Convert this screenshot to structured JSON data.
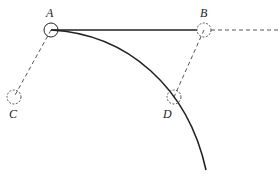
{
  "diagram": {
    "points": {
      "A": {
        "label": "A",
        "cx": 51,
        "cy": 30,
        "r": 7,
        "style": "solid"
      },
      "B": {
        "label": "B",
        "cx": 204,
        "cy": 30,
        "r": 7,
        "style": "dashed"
      },
      "C": {
        "label": "C",
        "cx": 14,
        "cy": 97,
        "r": 7,
        "style": "dashed"
      },
      "D": {
        "label": "D",
        "cx": 174,
        "cy": 97,
        "r": 7,
        "style": "dashed"
      }
    },
    "labels": {
      "A": "A",
      "B": "B",
      "C": "C",
      "D": "D"
    },
    "lines": [
      {
        "from": "A",
        "to": "B",
        "style": "solid"
      },
      {
        "from": "B",
        "to": "edge-right",
        "style": "dashed"
      },
      {
        "from": "A",
        "to": "C",
        "style": "dashed"
      },
      {
        "from": "B",
        "to": "D",
        "style": "dashed"
      }
    ],
    "curve": {
      "from": "A",
      "through": "D",
      "style": "solid",
      "description": "trajectory arc"
    },
    "colors": {
      "stroke": "#222222",
      "dashed": "#555555",
      "background": "#ffffff"
    }
  }
}
